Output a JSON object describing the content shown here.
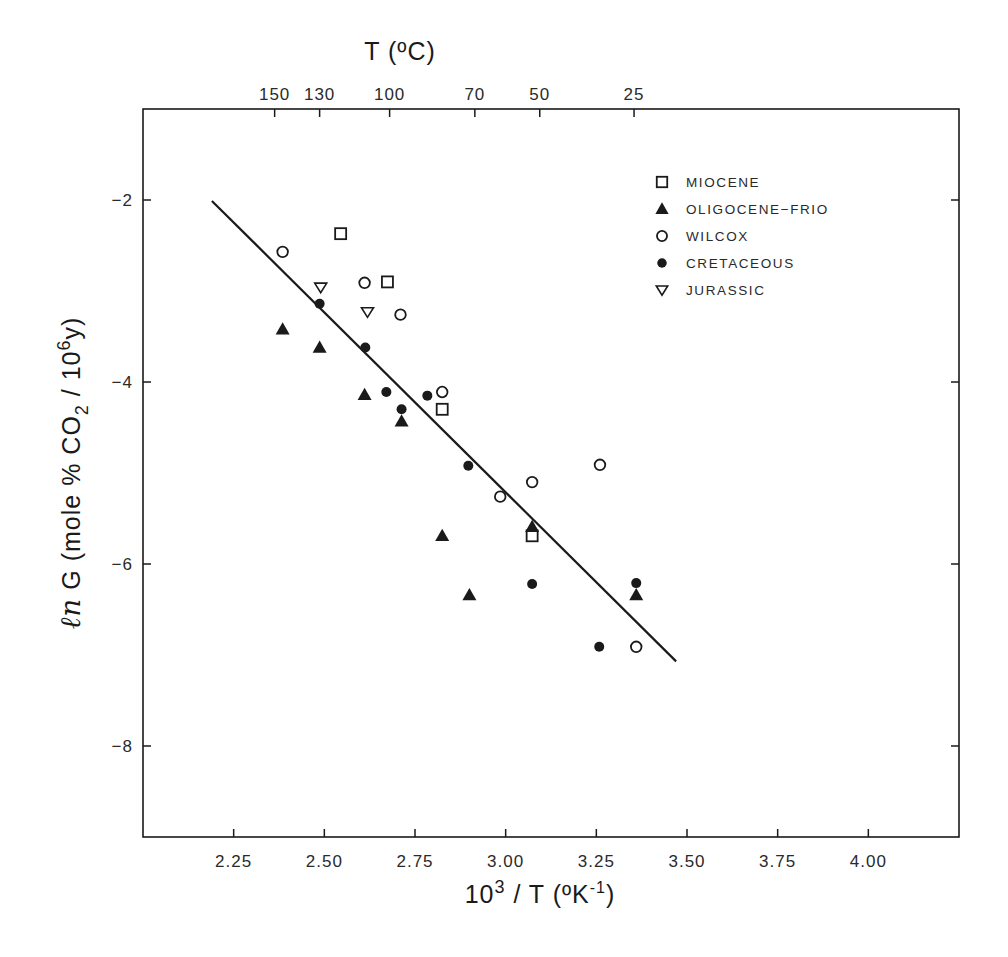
{
  "chart_data": {
    "type": "scatter",
    "title": "",
    "xlabel": "10^3 / T (ºK^-1)",
    "xlabel_parts": {
      "base": "10",
      "sup": "3",
      "rest": " / T (ºK",
      "sup2": "-1",
      "end": ")"
    },
    "ylabel": "ln G (mole % CO2 / 10^6 y)",
    "ylabel_parts": {
      "ln": "ℓn",
      "g": " G (mole % CO",
      "sub": "2",
      "mid": " / 10",
      "sup": "6",
      "end": "y)"
    },
    "top_xlabel": "T (ºC)",
    "xlim": [
      2.0,
      4.25
    ],
    "ylim": [
      -9,
      -1
    ],
    "grid": false,
    "legend_position": "upper right (inside)",
    "x_ticks": [
      {
        "value": 2.25,
        "label": "2.25"
      },
      {
        "value": 2.5,
        "label": "2.50"
      },
      {
        "value": 2.75,
        "label": "2.75"
      },
      {
        "value": 3.0,
        "label": "3.00"
      },
      {
        "value": 3.25,
        "label": "3.25"
      },
      {
        "value": 3.5,
        "label": "3.50"
      },
      {
        "value": 3.75,
        "label": "3.75"
      },
      {
        "value": 4.0,
        "label": "4.00"
      }
    ],
    "y_ticks": [
      {
        "value": -2,
        "label": "−2"
      },
      {
        "value": -4,
        "label": "−4"
      },
      {
        "value": -6,
        "label": "−6"
      },
      {
        "value": -8,
        "label": "−8"
      }
    ],
    "top_ticks": [
      {
        "label": "150",
        "x": 2.363
      },
      {
        "label": "130",
        "x": 2.487
      },
      {
        "label": "100",
        "x": 2.68
      },
      {
        "label": "70",
        "x": 2.915
      },
      {
        "label": "50",
        "x": 3.094
      },
      {
        "label": "25",
        "x": 3.354
      }
    ],
    "series": [
      {
        "name": "MIOCENE",
        "marker": "open-square",
        "points": [
          [
            2.545,
            -2.37
          ],
          [
            2.674,
            -2.9
          ],
          [
            2.825,
            -4.3
          ],
          [
            3.073,
            -5.69
          ]
        ]
      },
      {
        "name": "OLIGOCENE−FRIO",
        "marker": "filled-triangle",
        "points": [
          [
            2.385,
            -3.42
          ],
          [
            2.487,
            -3.62
          ],
          [
            2.611,
            -4.14
          ],
          [
            2.713,
            -4.43
          ],
          [
            2.825,
            -5.69
          ],
          [
            2.9,
            -6.34
          ],
          [
            3.073,
            -5.59
          ],
          [
            3.36,
            -6.34
          ]
        ]
      },
      {
        "name": "WILCOX",
        "marker": "open-circle",
        "points": [
          [
            2.385,
            -2.57
          ],
          [
            2.611,
            -2.91
          ],
          [
            2.71,
            -3.26
          ],
          [
            2.825,
            -4.11
          ],
          [
            2.985,
            -5.26
          ],
          [
            3.073,
            -5.1
          ],
          [
            3.26,
            -4.91
          ],
          [
            3.36,
            -6.91
          ]
        ]
      },
      {
        "name": "CRETACEOUS",
        "marker": "filled-circle",
        "points": [
          [
            2.487,
            -3.14
          ],
          [
            2.613,
            -3.62
          ],
          [
            2.671,
            -4.11
          ],
          [
            2.713,
            -4.3
          ],
          [
            2.784,
            -4.15
          ],
          [
            2.897,
            -4.92
          ],
          [
            3.073,
            -6.22
          ],
          [
            3.36,
            -6.21
          ],
          [
            3.258,
            -6.91
          ]
        ]
      },
      {
        "name": "JURASSIC",
        "marker": "open-down-triangle",
        "points": [
          [
            2.49,
            -2.96
          ],
          [
            2.619,
            -3.23
          ]
        ]
      }
    ],
    "fit_line": {
      "x": [
        2.19,
        3.47
      ],
      "y": [
        -2.01,
        -7.07
      ]
    }
  },
  "colors": {
    "ink": "#1a1a1a",
    "background": "#ffffff"
  }
}
